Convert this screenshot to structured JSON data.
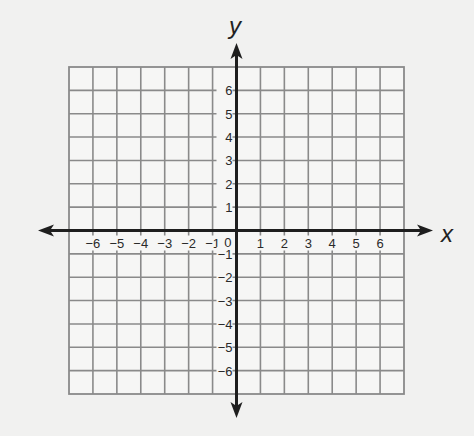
{
  "diagram": {
    "type": "coordinate-plane",
    "x_axis_label": "x",
    "y_axis_label": "y",
    "origin_label": "0",
    "x_range": [
      -7,
      7
    ],
    "y_range": [
      -7,
      7
    ],
    "grid_cells": {
      "columns": 14,
      "rows": 14
    },
    "x_tick_labels": [
      "−6",
      "−5",
      "−4",
      "−3",
      "−2",
      "−1",
      "1",
      "2",
      "3",
      "4",
      "5",
      "6"
    ],
    "x_tick_values": [
      -6,
      -5,
      -4,
      -3,
      -2,
      -1,
      1,
      2,
      3,
      4,
      5,
      6
    ],
    "y_tick_labels": [
      "6",
      "5",
      "4",
      "3",
      "2",
      "1",
      "−1",
      "−2",
      "−3",
      "−4",
      "−5",
      "−6"
    ],
    "y_tick_values": [
      6,
      5,
      4,
      3,
      2,
      1,
      -1,
      -2,
      -3,
      -4,
      -5,
      -6
    ],
    "colors": {
      "background": "#f1f1f0",
      "grid": "#8a8a8a",
      "axis": "#1e1e1e"
    }
  }
}
